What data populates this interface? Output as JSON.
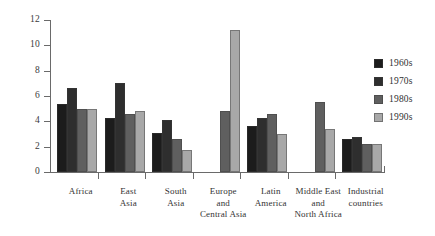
{
  "chart_data": {
    "type": "bar",
    "title": "",
    "subtitle": "",
    "xlabel": "",
    "ylabel": "",
    "ylim": [
      0,
      12
    ],
    "yticks": [
      0,
      2,
      4,
      6,
      8,
      10,
      12
    ],
    "grid": false,
    "legend_position": "right",
    "categories": [
      "Africa",
      "East Asia",
      "South Asia",
      "Europe and Central Asia",
      "Latin America",
      "Middle East and North Africa",
      "Industrial countries"
    ],
    "category_lines": [
      [
        "Africa"
      ],
      [
        "East",
        "Asia"
      ],
      [
        "South",
        "Asia"
      ],
      [
        "Europe",
        "and",
        "Central Asia"
      ],
      [
        "Latin",
        "America"
      ],
      [
        "Middle East",
        "and",
        "North Africa"
      ],
      [
        "Industrial",
        "countries"
      ]
    ],
    "series": [
      {
        "name": "1960s",
        "color": "#1c1c1c",
        "values": [
          5.4,
          4.3,
          3.1,
          null,
          3.6,
          null,
          2.6
        ]
      },
      {
        "name": "1970s",
        "color": "#2e2e2e",
        "values": [
          6.6,
          7.0,
          4.1,
          null,
          4.3,
          null,
          2.8
        ]
      },
      {
        "name": "1980s",
        "color": "#5f5f5f",
        "values": [
          4.95,
          4.6,
          2.6,
          4.8,
          4.6,
          5.5,
          2.2
        ]
      },
      {
        "name": "1990s",
        "color": "#a8a8a8",
        "values": [
          4.95,
          4.8,
          1.7,
          11.2,
          3.0,
          3.4,
          2.2
        ]
      }
    ]
  },
  "legend": {
    "items": [
      {
        "label": "1960s",
        "color": "#1c1c1c"
      },
      {
        "label": "1970s",
        "color": "#2e2e2e"
      },
      {
        "label": "1980s",
        "color": "#5f5f5f"
      },
      {
        "label": "1990s",
        "color": "#a8a8a8"
      }
    ]
  },
  "axis": {
    "y_tick_labels": [
      "0",
      "2",
      "4",
      "6",
      "8",
      "10",
      "12"
    ]
  }
}
